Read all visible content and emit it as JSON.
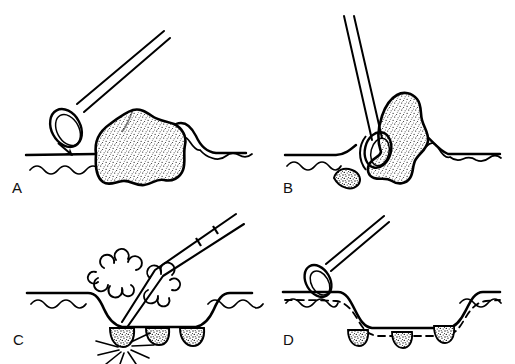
{
  "figure": {
    "background_color": "#ffffff",
    "ink_color": "#000000",
    "width": 515,
    "height": 364,
    "style": "black-and-white line drawing with stippled shading"
  },
  "panels": [
    {
      "id": "A",
      "label": "A",
      "caption": "Open snare loop advanced toward sessile lobulated polyp on mucosal surface; arrow indicates direction of approach",
      "elements": {
        "catheter": "snare catheter shaft angled from upper right",
        "snare_loop": "open elliptical wire loop",
        "arrow": "down-right pointing arrow",
        "polyp": "sessile lobulated stippled mass",
        "mucosa_line": "straight mucosal surface line",
        "muscularis_line": "wavy submucosal line"
      }
    },
    {
      "id": "B",
      "label": "B",
      "caption": "Snare loop cinched around the base of the polyp; catheter held near vertical",
      "elements": {
        "catheter": "near-vertical snare catheter shaft",
        "snare_loop": "loop tightened at polyp base",
        "polyp": "stippled polyp elevated above mucosa",
        "mucosa_line": "mucosal surface tented upward at polyp",
        "muscularis_line": "wavy submucosal line"
      }
    },
    {
      "id": "C",
      "label": "C",
      "caption": "Electrocautery applied at the resection site producing smoke plumes and radiating sparks; residual stippled nodules along crater base",
      "elements": {
        "catheter": "angled cautery catheter with band marking on shaft",
        "smoke_plumes": "cloud-shaped puffs on both sides of the tip",
        "sparks": "radiating straight spark lines from the cautery point",
        "crater": "resected mucosal depression",
        "residual_nodules": "three small stippled nodules",
        "mucosa_line": "mucosal surface line",
        "muscularis_line": "wavy submucosal line"
      }
    },
    {
      "id": "D",
      "label": "D",
      "caption": "Completed resection: snare withdrawn, broad mucosal defect remains with dashed submucosal plane and residual nodules",
      "elements": {
        "catheter": "withdrawn snare catheter with open loop at upper left",
        "snare_loop": "open elliptical wire loop",
        "crater": "broad flat-bottomed resection defect",
        "dashed_plane": "dashed submucosal boundary line",
        "residual_nodules": "three small stippled nodules beneath the dashed line",
        "mucosa_line": "mucosal surface line",
        "muscularis_line": "wavy submucosal line"
      }
    }
  ]
}
